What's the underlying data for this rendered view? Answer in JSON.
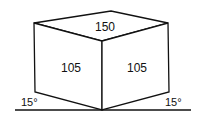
{
  "diagram": {
    "faces": {
      "top": {
        "label": "150"
      },
      "left": {
        "label": "105"
      },
      "right": {
        "label": "105"
      }
    },
    "angles": {
      "left": {
        "label": "15°"
      },
      "right": {
        "label": "15°"
      }
    },
    "colors": {
      "line": "#111111",
      "background": "#ffffff"
    }
  }
}
